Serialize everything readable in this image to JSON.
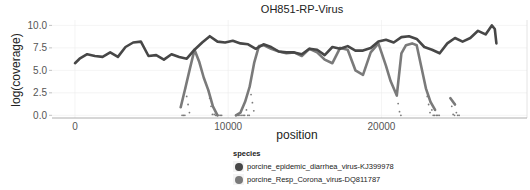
{
  "chart_data": {
    "type": "line",
    "title": "OH851-RP-Virus",
    "xlabel": "position",
    "ylabel": "log(coverage)",
    "xlim": [
      -1500,
      29500
    ],
    "ylim": [
      -0.3,
      10.6
    ],
    "x_ticks": [
      0,
      10000,
      20000
    ],
    "x_tick_labels": [
      "0",
      "10000",
      "20000"
    ],
    "y_ticks": [
      0.0,
      2.5,
      5.0,
      7.5,
      10.0
    ],
    "y_tick_labels": [
      "0.0",
      "2.5",
      "5.0",
      "7.5",
      "10.0"
    ],
    "grid": true,
    "legend_position": "bottom",
    "legend_title": "species",
    "series": [
      {
        "name": "porcine_epidemic_diarrhea_virus-KJ399978",
        "color": "#474747",
        "x": [
          0,
          300,
          800,
          1300,
          1800,
          2300,
          2800,
          3300,
          3800,
          4300,
          4800,
          5300,
          5800,
          6300,
          6800,
          7300,
          7800,
          8300,
          8800,
          9300,
          9800,
          10300,
          10800,
          11300,
          11800,
          12300,
          12800,
          13300,
          13800,
          14300,
          14800,
          15300,
          15800,
          16300,
          16800,
          17300,
          17800,
          18300,
          18800,
          19300,
          19800,
          20300,
          20800,
          21300,
          21800,
          22300,
          22800,
          23300,
          23800,
          24300,
          24800,
          25300,
          25800,
          26300,
          26800,
          27200,
          27400,
          27500
        ],
        "values": [
          5.8,
          6.3,
          6.8,
          6.6,
          6.5,
          7.0,
          6.5,
          7.6,
          8.1,
          8.2,
          6.6,
          6.7,
          6.2,
          6.8,
          6.5,
          6.3,
          7.3,
          8.1,
          8.8,
          8.2,
          8.1,
          8.3,
          8.0,
          7.9,
          7.4,
          7.9,
          7.6,
          7.1,
          7.0,
          7.0,
          6.8,
          7.4,
          7.3,
          6.7,
          7.6,
          7.4,
          7.7,
          7.2,
          7.2,
          7.5,
          8.2,
          8.4,
          8.1,
          8.7,
          8.8,
          8.5,
          7.6,
          7.3,
          6.9,
          8.0,
          8.6,
          8.2,
          8.6,
          9.4,
          9.0,
          10.0,
          9.6,
          8.0
        ]
      },
      {
        "name": "porcine_Resp_Corona_virus-DQ811787",
        "color": "#7a7a7a",
        "x": [
          6900,
          7200,
          7500,
          7800,
          8100,
          8400,
          8700,
          9000,
          9300,
          10500,
          10800,
          11100,
          11400,
          11700,
          12000,
          12300,
          12800,
          13300,
          13800,
          14300,
          14800,
          15300,
          15800,
          16300,
          16800,
          17300,
          17800,
          18300,
          18800,
          19300,
          19800,
          20300,
          20600,
          21000,
          21300,
          21600,
          22000,
          22300,
          22600,
          22900,
          23200,
          23500,
          24500,
          24800
        ],
        "values": [
          0.9,
          3.0,
          5.2,
          7.3,
          6.0,
          4.2,
          2.8,
          1.0,
          0.0,
          0.0,
          0.3,
          1.5,
          3.2,
          5.9,
          7.7,
          7.8,
          7.4,
          7.1,
          6.9,
          7.0,
          6.6,
          7.4,
          7.0,
          6.2,
          5.8,
          7.5,
          7.3,
          5.0,
          4.5,
          7.0,
          8.0,
          5.5,
          3.8,
          2.2,
          6.9,
          7.8,
          8.0,
          7.8,
          5.4,
          3.0,
          1.5,
          0.6,
          1.9,
          1.2
        ]
      }
    ]
  },
  "legend": {
    "title": "species",
    "items": [
      {
        "label": "porcine_epidemic_diarrhea_virus-KJ399978",
        "color": "#474747"
      },
      {
        "label": "porcine_Resp_Corona_virus-DQ811787",
        "color": "#7a7a7a"
      }
    ]
  }
}
